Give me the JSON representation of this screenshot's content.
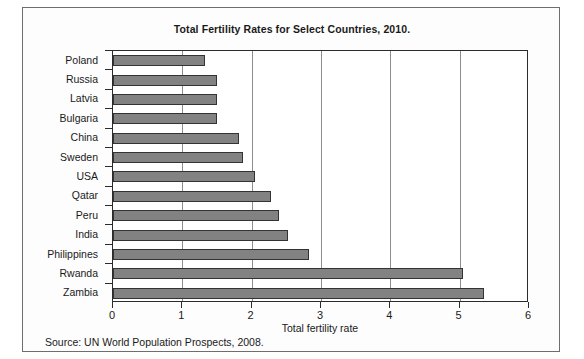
{
  "page": {
    "source_note": "Source: UN World Population Prospects, 2008."
  },
  "chart_data": {
    "type": "bar",
    "orientation": "horizontal",
    "title": "Total Fertility Rates for Select Countries, 2010.",
    "xlabel": "Total fertility rate",
    "ylabel": "",
    "xlim": [
      0,
      6
    ],
    "xticks": [
      "0",
      "1",
      "2",
      "3",
      "4",
      "5",
      "6"
    ],
    "grid": "vertical",
    "legend": "none",
    "bar_color": "#828282",
    "bar_border_color": "#333333",
    "categories": [
      "Poland",
      "Russia",
      "Latvia",
      "Bulgaria",
      "China",
      "Sweden",
      "USA",
      "Qatar",
      "Peru",
      "India",
      "Philippines",
      "Rwanda",
      "Zambia"
    ],
    "values": [
      1.32,
      1.5,
      1.5,
      1.5,
      1.82,
      1.88,
      2.05,
      2.28,
      2.4,
      2.52,
      2.83,
      5.05,
      5.35
    ]
  }
}
